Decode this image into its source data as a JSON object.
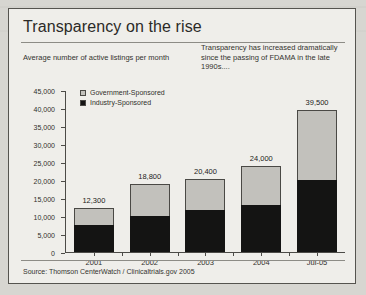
{
  "figure": {
    "title": "Transparency on the rise",
    "subtitle": "Average number of active listings per month",
    "callout": "Transparency has increased dramatically since the passing of FDAMA in the late 1990s....",
    "source": "Source: Thomson CenterWatch / Clinicaltrials.gov 2005"
  },
  "chart_data": {
    "type": "bar",
    "stacked": true,
    "title": "Transparency on the rise",
    "subtitle": "Average number of active listings per month",
    "xlabel": "",
    "ylabel": "",
    "ylim": [
      0,
      45000
    ],
    "yticks": [
      0,
      5000,
      10000,
      15000,
      20000,
      25000,
      30000,
      35000,
      40000,
      45000
    ],
    "ytick_labels": [
      "0",
      "5,000",
      "10,000",
      "15,000",
      "20,000",
      "25,000",
      "30,000",
      "35,000",
      "40,000",
      "45,000"
    ],
    "grid": false,
    "legend_position": "top-left-inside",
    "categories": [
      "2001",
      "2002",
      "2003",
      "2004",
      "Jul-05"
    ],
    "series": [
      {
        "name": "Industry-Sponsored",
        "color": "#141413",
        "values": [
          7500,
          10000,
          11800,
          13000,
          20000
        ]
      },
      {
        "name": "Government-Sponsored",
        "color": "#c2c1bc",
        "values": [
          4800,
          8800,
          8600,
          11000,
          19500
        ]
      }
    ],
    "totals": [
      12300,
      18800,
      20400,
      24000,
      39500
    ],
    "total_labels": [
      "12,300",
      "18,800",
      "20,400",
      "24,000",
      "39,500"
    ],
    "annotations": [
      "Transparency has increased dramatically since the passing of FDAMA in the late 1990s...."
    ],
    "source": "Source: Thomson CenterWatch / Clinicaltrials.gov 2005"
  }
}
